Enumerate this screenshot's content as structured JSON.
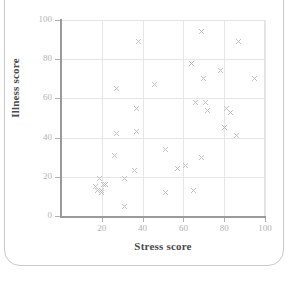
{
  "figure": {
    "frame": "rounded-card",
    "background_color": "#ffffff",
    "border_color": "#c9c9c9"
  },
  "chart_data": {
    "type": "scatter",
    "title": "",
    "xlabel": "Stress score",
    "ylabel": "Illness score",
    "xlim": [
      0,
      100
    ],
    "ylim": [
      0,
      100
    ],
    "xticks": [
      20,
      40,
      60,
      80,
      100
    ],
    "yticks": [
      0,
      20,
      40,
      60,
      80,
      100
    ],
    "xtick_labels": [
      "20",
      "40",
      "60",
      "80",
      "100"
    ],
    "ytick_labels": [
      "0",
      "20",
      "40",
      "60",
      "80",
      "100"
    ],
    "grid": true,
    "grid_color": "#e6e6e6",
    "legend": null,
    "marker": "x",
    "marker_color": "#bcbcbc",
    "series": [
      {
        "name": "observations",
        "points": [
          [
            17,
            15
          ],
          [
            18,
            13
          ],
          [
            19,
            19
          ],
          [
            20,
            13
          ],
          [
            20,
            12
          ],
          [
            21,
            16
          ],
          [
            22,
            16
          ],
          [
            26,
            31
          ],
          [
            27,
            65
          ],
          [
            27,
            42
          ],
          [
            31,
            19
          ],
          [
            31,
            5
          ],
          [
            36,
            23
          ],
          [
            37,
            55
          ],
          [
            37,
            43
          ],
          [
            38,
            89
          ],
          [
            46,
            67
          ],
          [
            51,
            34
          ],
          [
            51,
            12
          ],
          [
            57,
            24
          ],
          [
            61,
            26
          ],
          [
            64,
            78
          ],
          [
            65,
            13
          ],
          [
            66,
            58
          ],
          [
            69,
            94
          ],
          [
            69,
            30
          ],
          [
            70,
            70
          ],
          [
            71,
            58
          ],
          [
            72,
            54
          ],
          [
            78,
            74
          ],
          [
            80,
            45
          ],
          [
            81,
            55
          ],
          [
            83,
            53
          ],
          [
            86,
            41
          ],
          [
            87,
            89
          ],
          [
            95,
            70
          ]
        ]
      }
    ]
  }
}
